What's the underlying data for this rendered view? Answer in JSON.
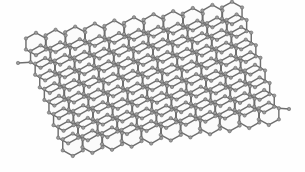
{
  "figure": {
    "title": "Graphene hexagonal lattice",
    "background_color": "#fefefe",
    "bond_color": "#6e6e6e",
    "atom_fill_color": "#9a9a9a",
    "atom_stroke_color": "#5f5f5f",
    "hexagon_face_color": "#fbfbfb",
    "canvas": {
      "width": 305,
      "height": 172
    }
  },
  "lattice": {
    "type": "honeycomb",
    "cells_u": 11,
    "cells_v": 9,
    "hex_radius": 11.6,
    "bond_stroke_width": 1.45,
    "atom_radius": 1.7,
    "origin_x": 36,
    "origin_y": 44,
    "basis": {
      "u": {
        "dx": 19.6,
        "dy": -3.1
      },
      "v": {
        "dx": 4.6,
        "dy": 12.6
      }
    },
    "perspective": {
      "shear_x": 0.52,
      "squash_y": 0.41,
      "rotation_deg": -8
    },
    "dangling_atoms": [
      {
        "x": 18,
        "y": 63,
        "label": "left-edge-terminal-atom"
      },
      {
        "x": 289,
        "y": 109,
        "label": "right-edge-terminal-atom"
      }
    ]
  }
}
